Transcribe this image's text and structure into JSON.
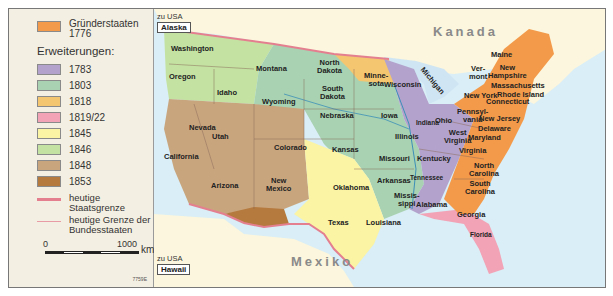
{
  "legend": {
    "founding": {
      "label_line1": "Gründerstaaten",
      "label_line2": "1776",
      "color": "#f39a4a"
    },
    "title": "Erweiterungen:",
    "items": [
      {
        "label": "1783",
        "color": "#b3a3cc"
      },
      {
        "label": "1803",
        "color": "#a8d2b2"
      },
      {
        "label": "1818",
        "color": "#f5c670"
      },
      {
        "label": "1819/22",
        "color": "#f2a3b6"
      },
      {
        "label": "1845",
        "color": "#fbf4a4"
      },
      {
        "label": "1846",
        "color": "#c4e3a2"
      },
      {
        "label": "1848",
        "color": "#c9a57e"
      },
      {
        "label": "1853",
        "color": "#b57a3e"
      }
    ],
    "lines": [
      {
        "line1": "heutige",
        "line2": "Staatsgrenze",
        "color": "#e47f8f"
      },
      {
        "line1": "heutige Grenze der",
        "line2": "Bundesstaaten",
        "color": "#e89aa5"
      }
    ],
    "scale": {
      "start": "0",
      "end": "1000",
      "unit": "km"
    },
    "code": "7759E"
  },
  "map": {
    "insets": [
      {
        "prefix": "zu USA",
        "name": "Alaska"
      },
      {
        "prefix": "zu USA",
        "name": "Hawaii"
      }
    ],
    "countries": {
      "north": "Kanada",
      "south": "Mexiko"
    },
    "states": [
      "Washington",
      "Oregon",
      "Idaho",
      "Montana",
      "Wyoming",
      "North Dakota",
      "South Dakota",
      "Nebraska",
      "Minnesota",
      "Iowa",
      "Wisconsin",
      "Michigan",
      "Illinois",
      "Indiana",
      "Ohio",
      "Nevada",
      "Utah",
      "California",
      "Colorado",
      "Kansas",
      "Missouri",
      "Arizona",
      "New Mexico",
      "Oklahoma",
      "Arkansas",
      "Texas",
      "Louisiana",
      "Mississippi",
      "Alabama",
      "Tennessee",
      "Kentucky",
      "Georgia",
      "Florida",
      "West Virginia",
      "Virginia",
      "North Carolina",
      "South Carolina",
      "Maryland",
      "Delaware",
      "New Jersey",
      "Pennsylvania",
      "New York",
      "Connecticut",
      "Rhode Island",
      "Massachusetts",
      "New Hampshire",
      "Vermont",
      "Maine"
    ],
    "labels": {
      "wa": "Washington",
      "or": "Oregon",
      "id": "Idaho",
      "mt": "Montana",
      "wy": "Wyoming",
      "nd1": "North",
      "nd2": "Dakota",
      "sd1": "South",
      "sd2": "Dakota",
      "ne": "Nebraska",
      "mn1": "Minne-",
      "mn2": "sota",
      "ia": "Iowa",
      "wi": "Wisconsin",
      "mi": "Michigan",
      "il": "Illinois",
      "in": "Indiana",
      "oh": "Ohio",
      "nv": "Nevada",
      "ut": "Utah",
      "ca": "California",
      "co": "Colorado",
      "ks": "Kansas",
      "mo": "Missouri",
      "az": "Arizona",
      "nm1": "New",
      "nm2": "Mexico",
      "ok": "Oklahoma",
      "ar": "Arkansas",
      "tx": "Texas",
      "la": "Louisiana",
      "ms1": "Missis-",
      "ms2": "sippi",
      "al": "Alabama",
      "tn": "Tennessee",
      "ky": "Kentucky",
      "ga": "Georgia",
      "fl": "Florida",
      "wv1": "West",
      "wv2": "Virginia",
      "va": "Virginia",
      "nc1": "North",
      "nc2": "Carolina",
      "sc1": "South",
      "sc2": "Carolina",
      "md": "Maryland",
      "de": "Delaware",
      "nj": "New Jersey",
      "pa1": "Pennsyl-",
      "pa2": "vania",
      "ny": "New York",
      "ct": "Connecticut",
      "ri": "Rhode Island",
      "ma": "Massachusetts",
      "nh1": "New",
      "nh2": "Hampshire",
      "vt1": "Ver-",
      "vt2": "mont",
      "me": "Maine"
    }
  }
}
